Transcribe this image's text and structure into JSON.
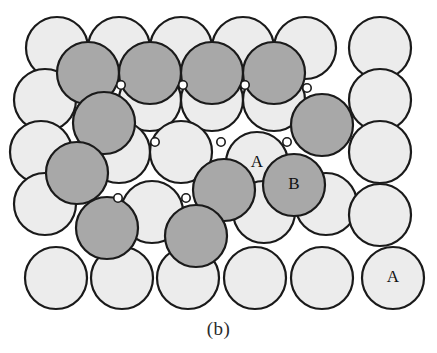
{
  "figure": {
    "caption": "(b)",
    "canvas": {
      "width": 437,
      "height": 353
    },
    "colors": {
      "background": "#ffffff",
      "layer_a_fill": "#ececec",
      "layer_b_fill": "#a8a8a8",
      "outline": "#1a1a1a",
      "void_fill": "#ffffff",
      "label_text": "#111111",
      "caption_text": "#2b2b2b"
    },
    "geometry": {
      "atom_radius": 31,
      "outline_width": 2.2,
      "row_spacing": 52,
      "column_spacing": 62
    }
  },
  "legend": {
    "layer_a_name": "A",
    "layer_b_name": "B",
    "layer_a_description": "light close-packed plane",
    "layer_b_description": "shaded close-packed plane"
  },
  "labels": [
    {
      "text": "A",
      "x": 257,
      "y": 163,
      "on_layer": "A"
    },
    {
      "text": "B",
      "x": 294,
      "y": 185,
      "on_layer": "B"
    },
    {
      "text": "A",
      "x": 393,
      "y": 278,
      "on_layer": "A"
    }
  ],
  "atoms": [
    {
      "id": "a-r1-c1",
      "layer": "A",
      "cx": 57,
      "cy": 48,
      "r": 31
    },
    {
      "id": "a-r1-c2",
      "layer": "A",
      "cx": 119,
      "cy": 48,
      "r": 31
    },
    {
      "id": "a-r1-c3",
      "layer": "A",
      "cx": 181,
      "cy": 48,
      "r": 31
    },
    {
      "id": "a-r1-c4",
      "layer": "A",
      "cx": 243,
      "cy": 48,
      "r": 31
    },
    {
      "id": "a-r1-c5",
      "layer": "A",
      "cx": 305,
      "cy": 48,
      "r": 31
    },
    {
      "id": "a-r1-c6",
      "layer": "A",
      "cx": 380,
      "cy": 48,
      "r": 31
    },
    {
      "id": "a-r2-c1",
      "layer": "A",
      "cx": 45,
      "cy": 100,
      "r": 31
    },
    {
      "id": "a-r2-c2",
      "layer": "A",
      "cx": 150,
      "cy": 100,
      "r": 31
    },
    {
      "id": "a-r2-c3",
      "layer": "A",
      "cx": 212,
      "cy": 100,
      "r": 31
    },
    {
      "id": "a-r2-c4",
      "layer": "A",
      "cx": 274,
      "cy": 100,
      "r": 31
    },
    {
      "id": "a-r2-c5",
      "layer": "A",
      "cx": 380,
      "cy": 100,
      "r": 31
    },
    {
      "id": "a-r3-c1",
      "layer": "A",
      "cx": 41,
      "cy": 152,
      "r": 31
    },
    {
      "id": "a-r3-c2",
      "layer": "A",
      "cx": 119,
      "cy": 152,
      "r": 31
    },
    {
      "id": "a-r3-c3",
      "layer": "A",
      "cx": 181,
      "cy": 152,
      "r": 31
    },
    {
      "id": "a-r3-c4",
      "layer": "A",
      "cx": 257,
      "cy": 163,
      "r": 31
    },
    {
      "id": "a-r3-c5",
      "layer": "A",
      "cx": 380,
      "cy": 152,
      "r": 31
    },
    {
      "id": "a-r4-c1",
      "layer": "A",
      "cx": 45,
      "cy": 204,
      "r": 31
    },
    {
      "id": "a-r4-c2",
      "layer": "A",
      "cx": 152,
      "cy": 212,
      "r": 31
    },
    {
      "id": "a-r4-c3",
      "layer": "A",
      "cx": 264,
      "cy": 212,
      "r": 31
    },
    {
      "id": "a-r4-c4",
      "layer": "A",
      "cx": 326,
      "cy": 204,
      "r": 31
    },
    {
      "id": "a-r4-c5",
      "layer": "A",
      "cx": 380,
      "cy": 215,
      "r": 31
    },
    {
      "id": "a-r5-c1",
      "layer": "A",
      "cx": 56,
      "cy": 278,
      "r": 31
    },
    {
      "id": "a-r5-c2",
      "layer": "A",
      "cx": 122,
      "cy": 278,
      "r": 31
    },
    {
      "id": "a-r5-c3",
      "layer": "A",
      "cx": 188,
      "cy": 278,
      "r": 31
    },
    {
      "id": "a-r5-c4",
      "layer": "A",
      "cx": 255,
      "cy": 278,
      "r": 31
    },
    {
      "id": "a-r5-c5",
      "layer": "A",
      "cx": 322,
      "cy": 278,
      "r": 31
    },
    {
      "id": "a-r5-c6",
      "layer": "A",
      "cx": 393,
      "cy": 278,
      "r": 31
    },
    {
      "id": "b-r1-c1",
      "layer": "B",
      "cx": 88,
      "cy": 73,
      "r": 31
    },
    {
      "id": "b-r1-c2",
      "layer": "B",
      "cx": 150,
      "cy": 73,
      "r": 31
    },
    {
      "id": "b-r1-c3",
      "layer": "B",
      "cx": 212,
      "cy": 73,
      "r": 31
    },
    {
      "id": "b-r1-c4",
      "layer": "B",
      "cx": 274,
      "cy": 73,
      "r": 31
    },
    {
      "id": "b-r2-c1",
      "layer": "B",
      "cx": 104,
      "cy": 123,
      "r": 31
    },
    {
      "id": "b-r2-c2",
      "layer": "B",
      "cx": 322,
      "cy": 125,
      "r": 31
    },
    {
      "id": "b-r3-c1",
      "layer": "B",
      "cx": 77,
      "cy": 173,
      "r": 31
    },
    {
      "id": "b-r3-c2",
      "layer": "B",
      "cx": 224,
      "cy": 190,
      "r": 31
    },
    {
      "id": "b-r3-c3",
      "layer": "B",
      "cx": 294,
      "cy": 185,
      "r": 31
    },
    {
      "id": "b-r4-c1",
      "layer": "B",
      "cx": 107,
      "cy": 228,
      "r": 31
    },
    {
      "id": "b-r4-c2",
      "layer": "B",
      "cx": 196,
      "cy": 236,
      "r": 31
    }
  ],
  "voids": [
    {
      "id": "void-1",
      "x": 121,
      "y": 85
    },
    {
      "id": "void-2",
      "x": 183,
      "y": 85
    },
    {
      "id": "void-3",
      "y": 85,
      "x": 245
    },
    {
      "id": "void-4",
      "x": 307,
      "y": 88
    },
    {
      "id": "void-5",
      "x": 155,
      "y": 142
    },
    {
      "id": "void-6",
      "x": 221,
      "y": 142
    },
    {
      "id": "void-7",
      "x": 287,
      "y": 142
    },
    {
      "id": "void-8",
      "x": 118,
      "y": 198
    },
    {
      "id": "void-9",
      "x": 186,
      "y": 198
    }
  ]
}
